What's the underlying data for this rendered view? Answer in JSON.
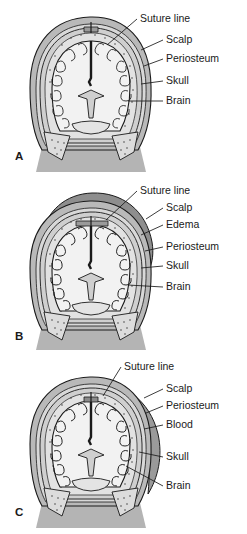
{
  "figure": {
    "panels": [
      {
        "id": "A",
        "letter": "A",
        "condition": "Normal newborn head cross-section",
        "labels": [
          {
            "text": "Suture line",
            "x": 140,
            "y": 22,
            "lx1": 137,
            "ly1": 19,
            "lx2": 107,
            "ly2": 45
          },
          {
            "text": "Scalp",
            "x": 166,
            "y": 43,
            "lx1": 163,
            "ly1": 40,
            "lx2": 141,
            "ly2": 50
          },
          {
            "text": "Periosteum",
            "x": 166,
            "y": 62,
            "lx1": 163,
            "ly1": 59,
            "lx2": 144,
            "ly2": 66
          },
          {
            "text": "Skull",
            "x": 166,
            "y": 84,
            "lx1": 163,
            "ly1": 81,
            "lx2": 141,
            "ly2": 84
          },
          {
            "text": "Brain",
            "x": 166,
            "y": 104,
            "lx1": 163,
            "ly1": 101,
            "lx2": 128,
            "ly2": 101
          }
        ]
      },
      {
        "id": "B",
        "letter": "B",
        "condition": "Caput succedaneum with edema crossing suture line",
        "labels": [
          {
            "text": "Suture line",
            "x": 140,
            "y": 16,
            "lx1": 137,
            "ly1": 13,
            "lx2": 106,
            "ly2": 42
          },
          {
            "text": "Scalp",
            "x": 166,
            "y": 33,
            "lx1": 163,
            "ly1": 30,
            "lx2": 146,
            "ly2": 41
          },
          {
            "text": "Edema",
            "x": 166,
            "y": 50,
            "lx1": 163,
            "ly1": 47,
            "lx2": 141,
            "ly2": 57
          },
          {
            "text": "Periosteum",
            "x": 166,
            "y": 72,
            "lx1": 163,
            "ly1": 69,
            "lx2": 145,
            "ly2": 73
          },
          {
            "text": "Skull",
            "x": 166,
            "y": 91,
            "lx1": 163,
            "ly1": 88,
            "lx2": 141,
            "ly2": 90
          },
          {
            "text": "Brain",
            "x": 166,
            "y": 112,
            "lx1": 163,
            "ly1": 109,
            "lx2": 128,
            "ly2": 107
          }
        ]
      },
      {
        "id": "C",
        "letter": "C",
        "condition": "Cephalohematoma with blood confined by suture line",
        "labels": [
          {
            "text": "Suture line",
            "x": 124,
            "y": 14,
            "lx1": 121,
            "ly1": 11,
            "lx2": 103,
            "ly2": 40
          },
          {
            "text": "Scalp",
            "x": 166,
            "y": 36,
            "lx1": 163,
            "ly1": 33,
            "lx2": 144,
            "ly2": 42
          },
          {
            "text": "Periosteum",
            "x": 166,
            "y": 53,
            "lx1": 163,
            "ly1": 50,
            "lx2": 146,
            "ly2": 57
          },
          {
            "text": "Blood",
            "x": 166,
            "y": 72,
            "lx1": 163,
            "ly1": 69,
            "lx2": 144,
            "ly2": 73
          },
          {
            "text": "Skull",
            "x": 166,
            "y": 104,
            "lx1": 163,
            "ly1": 101,
            "lx2": 139,
            "ly2": 96
          },
          {
            "text": "Brain",
            "x": 166,
            "y": 133,
            "lx1": 163,
            "ly1": 130,
            "lx2": 126,
            "ly2": 110
          }
        ]
      }
    ]
  },
  "colors": {
    "background": "#ffffff",
    "scalp": "#b9b9b9",
    "periosteum": "#d8d8d8",
    "skull": "#cfcfcf",
    "skull_inner": "#e2e2e2",
    "brain": "#f2f2f2",
    "brain_outline": "#1a1a1a",
    "ventricle": "#cfcfcf",
    "neck": "#b4b4b4",
    "edema": "#8e8e8e",
    "blood": "#9a9a9a",
    "outline": "#1a1a1a",
    "label_text": "#1a1a1a"
  }
}
